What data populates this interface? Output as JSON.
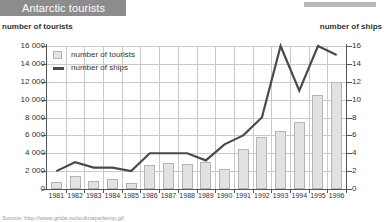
{
  "header": {
    "title": "Antarctic tourists",
    "corner_accent_color": "#b9b9b9",
    "title_bar_color": "#8c8c8c"
  },
  "axis_captions": {
    "left": "number of tourists",
    "right": "number of ships"
  },
  "legend": {
    "items": [
      {
        "label": "number of tourists",
        "marker": "bar-swatch",
        "color": "#e2e2e2"
      },
      {
        "label": "number of ships",
        "marker": "line-swatch",
        "color": "#4a4a4a"
      }
    ]
  },
  "source": {
    "text": "Source:  http://www.grida.no/soilmaps/temp.gif"
  },
  "chart_data": {
    "type": "bar",
    "title": "Antarctic tourists",
    "xlabel": "",
    "ylabel": "number of tourists",
    "y2label": "number of ships",
    "grid": true,
    "legend_position": "top-left",
    "categories": [
      "1981",
      "1982",
      "1983",
      "1984",
      "1985",
      "1986",
      "1987",
      "1988",
      "1989",
      "1990",
      "1991",
      "1992",
      "1993",
      "1994",
      "1995",
      "1996"
    ],
    "ylim": [
      0,
      16000
    ],
    "yticks": [
      "0",
      "2 000",
      "4 000",
      "6 000",
      "8 000",
      "10 000",
      "12 000",
      "14 000",
      "16 000"
    ],
    "y2lim": [
      0,
      16
    ],
    "y2ticks": [
      "0",
      "2",
      "4",
      "6",
      "8",
      "10",
      "12",
      "14",
      "16"
    ],
    "series": [
      {
        "name": "number of tourists",
        "axis": "left",
        "type": "bar",
        "color": "#e2e2e2",
        "values": [
          800,
          1400,
          900,
          1100,
          700,
          2700,
          2900,
          2800,
          3000,
          2200,
          4500,
          5800,
          6500,
          7500,
          10500,
          12000
        ]
      },
      {
        "name": "number of ships",
        "axis": "right",
        "type": "line",
        "color": "#4a4a4a",
        "values": [
          2,
          3,
          2.4,
          2.4,
          2,
          4,
          4,
          4,
          3.2,
          5,
          6,
          8,
          16,
          11,
          16,
          15
        ]
      }
    ]
  }
}
